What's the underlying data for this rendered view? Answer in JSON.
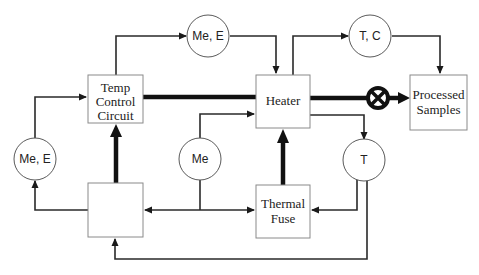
{
  "diagram": {
    "type": "block-flow",
    "blocks": [
      {
        "id": "temp_control",
        "lines": [
          "Temp",
          "Control",
          "Circuit"
        ]
      },
      {
        "id": "heater",
        "lines": [
          "Heater"
        ]
      },
      {
        "id": "processed_samples",
        "lines": [
          "Processed",
          "Samples"
        ]
      },
      {
        "id": "unlabeled_block",
        "lines": []
      },
      {
        "id": "thermal_fuse",
        "lines": [
          "Thermal",
          "Fuse"
        ]
      }
    ],
    "circles": [
      {
        "id": "me_e_top",
        "label": "Me, E"
      },
      {
        "id": "t_c",
        "label": "T, C"
      },
      {
        "id": "me_e_left",
        "label": "Me, E"
      },
      {
        "id": "me",
        "label": "Me"
      },
      {
        "id": "t",
        "label": "T"
      }
    ],
    "valve": {
      "id": "valve",
      "symbol": "circle-x"
    },
    "colors": {
      "line": "#2a2a2a",
      "box_border": "#8a8a8a",
      "background": "#ffffff"
    }
  }
}
